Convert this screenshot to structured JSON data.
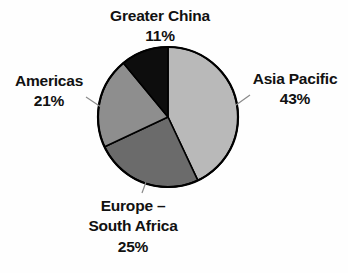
{
  "chart_data": {
    "type": "pie",
    "title": "",
    "subtitle": "",
    "xlabel": "",
    "ylabel": "",
    "legend_position": "none",
    "grid": false,
    "start_angle_deg": 0,
    "direction": "clockwise",
    "units": "percent",
    "total": 100,
    "categories": [
      "Asia Pacific",
      "Europe – South Africa",
      "Americas",
      "Greater China"
    ],
    "values": [
      43,
      25,
      21,
      11
    ],
    "value_labels": [
      "43%",
      "25%",
      "21%",
      "11%"
    ],
    "colors": [
      "#b9b9b9",
      "#6b6b6b",
      "#8e8e8e",
      "#0d0d0d"
    ],
    "slices": [
      {
        "name": "Asia Pacific",
        "value": 43,
        "value_label": "43%",
        "color": "#b9b9b9",
        "start_angle_deg": 0,
        "end_angle_deg": 154.8
      },
      {
        "name": "Europe – South Africa",
        "name_line1": "Europe –",
        "name_line2": "South Africa",
        "value": 25,
        "value_label": "25%",
        "color": "#6b6b6b",
        "start_angle_deg": 154.8,
        "end_angle_deg": 244.8
      },
      {
        "name": "Americas",
        "value": 21,
        "value_label": "21%",
        "color": "#8e8e8e",
        "start_angle_deg": 244.8,
        "end_angle_deg": 320.4
      },
      {
        "name": "Greater China",
        "value": 11,
        "value_label": "11%",
        "color": "#0d0d0d",
        "start_angle_deg": 320.4,
        "end_angle_deg": 360
      }
    ]
  },
  "labels": {
    "greater_china": {
      "name": "Greater China",
      "percent": "11%"
    },
    "asia_pacific": {
      "name": "Asia Pacific",
      "percent": "43%"
    },
    "americas": {
      "name": "Americas",
      "percent": "21%"
    },
    "europe_south_africa": {
      "name_line1": "Europe –",
      "name_line2": "South Africa",
      "percent": "25%"
    }
  },
  "style": {
    "background": "#fefefe",
    "outline_color": "#000000",
    "leader_line_color": "#8a8a8a",
    "text_color": "#111111"
  }
}
